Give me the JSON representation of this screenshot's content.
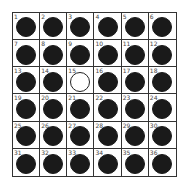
{
  "board": {
    "rows": 6,
    "cols": 6,
    "colors": {
      "filled": "#1a1a1a",
      "empty": "#ffffff",
      "grid": "#333333"
    },
    "cells": [
      {
        "n": "1",
        "state": "filled"
      },
      {
        "n": "2",
        "state": "filled"
      },
      {
        "n": "3",
        "state": "filled"
      },
      {
        "n": "4",
        "state": "filled"
      },
      {
        "n": "5",
        "state": "filled"
      },
      {
        "n": "6",
        "state": "filled"
      },
      {
        "n": "7",
        "state": "filled"
      },
      {
        "n": "8",
        "state": "filled"
      },
      {
        "n": "9",
        "state": "filled"
      },
      {
        "n": "10",
        "state": "filled"
      },
      {
        "n": "11",
        "state": "filled"
      },
      {
        "n": "12",
        "state": "filled"
      },
      {
        "n": "13",
        "state": "filled"
      },
      {
        "n": "14",
        "state": "filled"
      },
      {
        "n": "15",
        "state": "empty"
      },
      {
        "n": "16",
        "state": "filled"
      },
      {
        "n": "17",
        "state": "filled"
      },
      {
        "n": "18",
        "state": "filled"
      },
      {
        "n": "19",
        "state": "filled"
      },
      {
        "n": "20",
        "state": "filled"
      },
      {
        "n": "21",
        "state": "filled"
      },
      {
        "n": "22",
        "state": "filled"
      },
      {
        "n": "23",
        "state": "filled"
      },
      {
        "n": "24",
        "state": "filled"
      },
      {
        "n": "25",
        "state": "filled"
      },
      {
        "n": "26",
        "state": "filled"
      },
      {
        "n": "27",
        "state": "filled"
      },
      {
        "n": "28",
        "state": "filled"
      },
      {
        "n": "29",
        "state": "filled"
      },
      {
        "n": "30",
        "state": "filled"
      },
      {
        "n": "31",
        "state": "filled"
      },
      {
        "n": "32",
        "state": "filled"
      },
      {
        "n": "33",
        "state": "filled"
      },
      {
        "n": "34",
        "state": "filled"
      },
      {
        "n": "35",
        "state": "filled"
      },
      {
        "n": "36",
        "state": "filled"
      }
    ]
  }
}
